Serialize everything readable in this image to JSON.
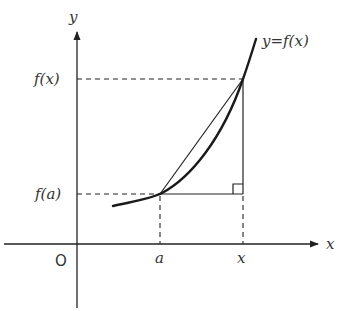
{
  "diagram": {
    "title": "",
    "axes": {
      "x_label": "x",
      "y_label": "y",
      "origin_label": "O"
    },
    "curve_label": "y=f(x)",
    "y_ticks": [
      {
        "label": "f(x)",
        "meaning": "value of f at x"
      },
      {
        "label": "f(a)",
        "meaning": "value of f at a"
      }
    ],
    "x_ticks": [
      {
        "label": "a"
      },
      {
        "label": "x"
      }
    ],
    "elements": {
      "curve": "increasing convex curve y=f(x)",
      "secant": "chord from (a, f(a)) to (x, f(x))",
      "right_triangle": "horizontal leg from (a,f(a)) to (x,f(a)), vertical leg up to (x,f(x)), right-angle marker at (x, f(a))",
      "dashed_guides": [
        "horizontal from f(x) on y-axis to point",
        "horizontal from f(a) on y-axis to point",
        "vertical from a on x-axis to curve",
        "vertical from x on x-axis to triangle corner"
      ]
    },
    "colors": {
      "ink": "#222222",
      "label": "#333333",
      "background": "#ffffff"
    }
  }
}
